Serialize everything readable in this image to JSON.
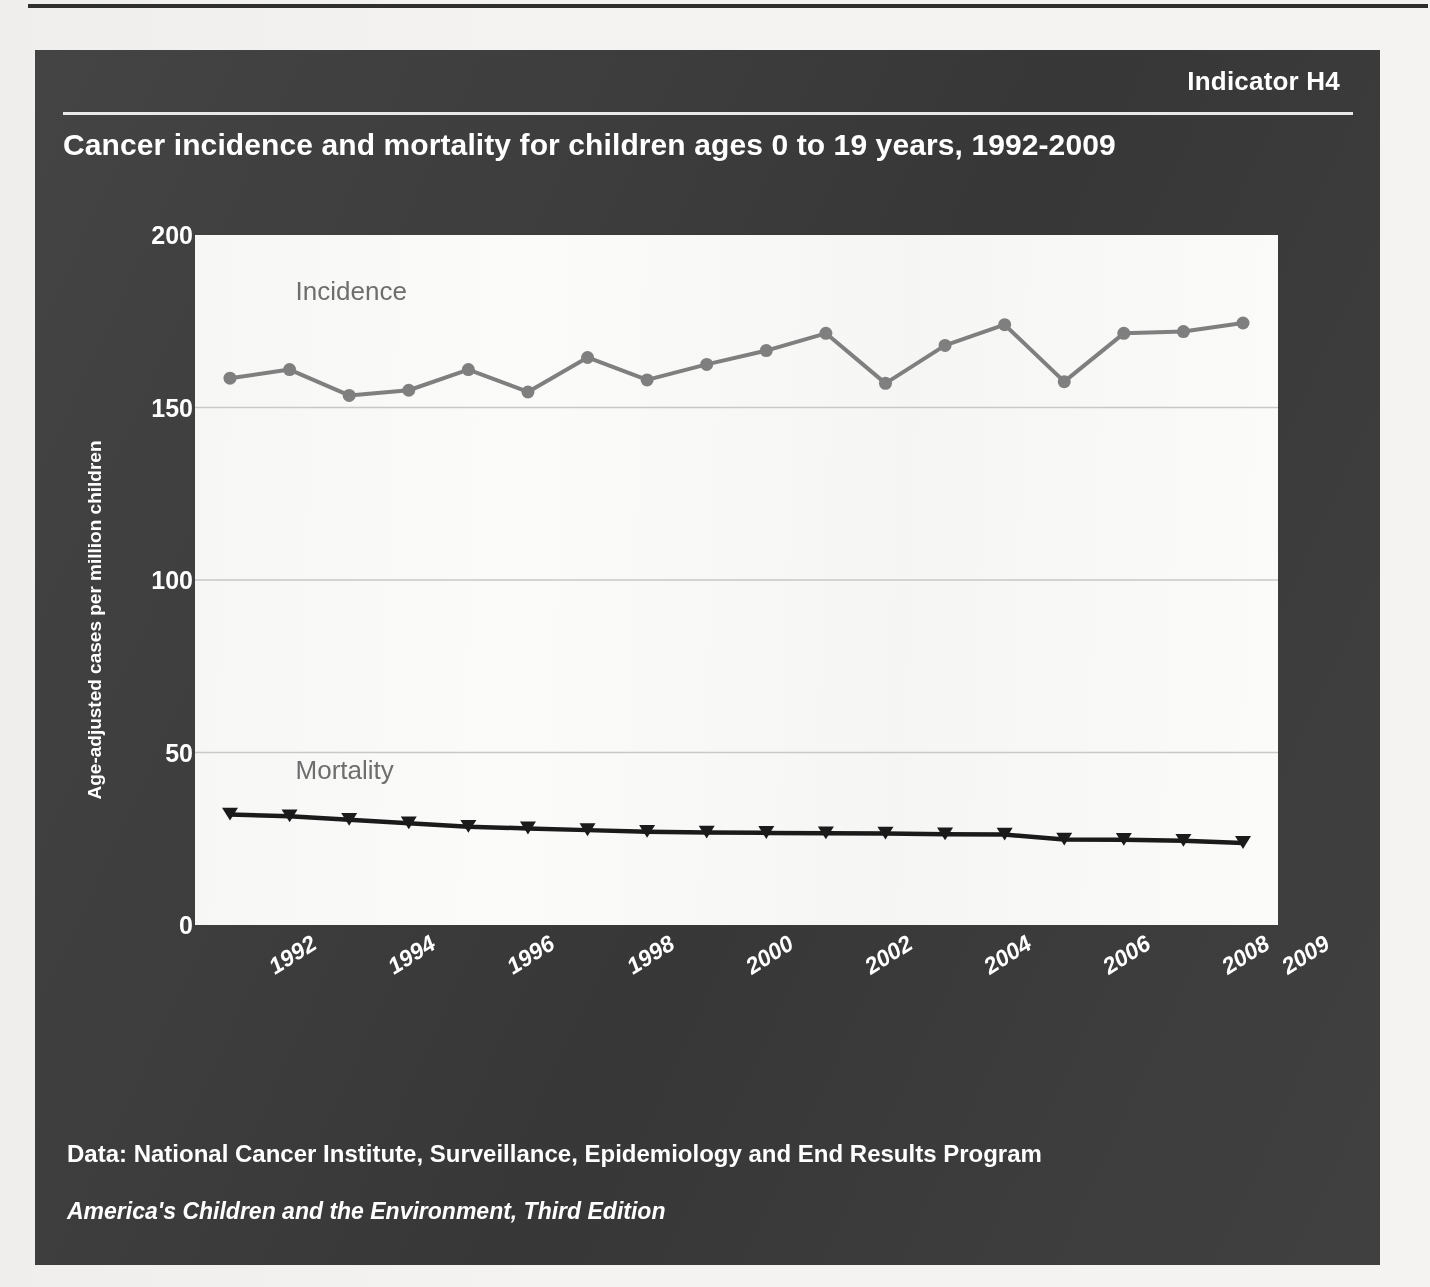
{
  "header": {
    "indicator": "Indicator H4",
    "title": "Cancer incidence and mortality for children ages 0 to 19 years, 1992-2009"
  },
  "footer": {
    "data_source": "Data: National Cancer Institute, Surveillance, Epidemiology and End Results Program",
    "publication": "America's Children and the Environment, Third Edition"
  },
  "colors": {
    "panel_background": "#3a3a3a",
    "plot_background": "#fbfbfa",
    "incidence_line": "#7f7f7f",
    "mortality_line": "#1a1a1a",
    "gridline": "#c9c9c9",
    "text_light": "#ffffff",
    "series_label": "#6e6e6e"
  },
  "chart_data": {
    "type": "line",
    "title": "Cancer incidence and mortality for children ages 0 to 19 years, 1992-2009",
    "xlabel": "",
    "ylabel": "Age-adjusted cases per million children",
    "ylim": [
      0,
      200
    ],
    "yticks": [
      0,
      50,
      100,
      150,
      200
    ],
    "ytick_labels": [
      "0",
      "50",
      "100",
      "150",
      "200"
    ],
    "grid": true,
    "legend_position": "inline-annotation",
    "x": [
      1992,
      1993,
      1994,
      1995,
      1996,
      1997,
      1998,
      1999,
      2000,
      2001,
      2002,
      2003,
      2004,
      2005,
      2006,
      2007,
      2008,
      2009
    ],
    "xtick_labels": [
      "1992",
      "1994",
      "1996",
      "1998",
      "2000",
      "2002",
      "2004",
      "2006",
      "2008",
      "2009"
    ],
    "xticks": [
      1992,
      1994,
      1996,
      1998,
      2000,
      2002,
      2004,
      2006,
      2008,
      2009
    ],
    "series": [
      {
        "name": "Incidence",
        "marker": "circle",
        "color": "#7f7f7f",
        "values": [
          158.5,
          161.0,
          153.5,
          155.0,
          161.0,
          154.5,
          164.5,
          158.0,
          162.5,
          166.5,
          171.5,
          157.0,
          168.0,
          174.0,
          157.5,
          171.5,
          172.0,
          174.5
        ]
      },
      {
        "name": "Mortality",
        "marker": "triangle-down",
        "color": "#1a1a1a",
        "values": [
          32.0,
          31.5,
          30.5,
          29.5,
          28.5,
          28.0,
          27.5,
          27.0,
          26.8,
          26.7,
          26.6,
          26.5,
          26.3,
          26.2,
          24.8,
          24.7,
          24.4,
          23.8
        ]
      }
    ],
    "annotations": [
      {
        "text": "Incidence",
        "x": 1993.1,
        "y": 183
      },
      {
        "text": "Mortality",
        "x": 1993.1,
        "y": 44
      }
    ]
  }
}
